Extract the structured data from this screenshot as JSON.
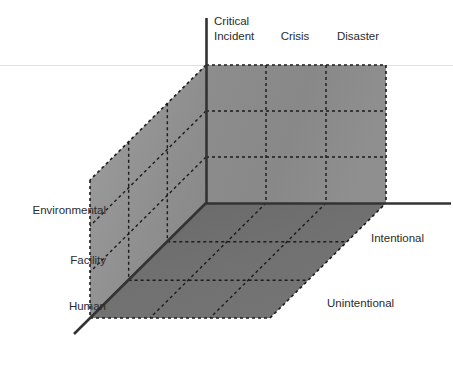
{
  "figure": {
    "title": "",
    "kind": "3d-cube-taxonomy-diagram"
  },
  "chart_data": {
    "type": "scatter",
    "title": "",
    "subtitle": "",
    "xlabel": "",
    "ylabel": "",
    "zlabel": "",
    "grid": true,
    "legend_position": "none",
    "axes": [
      {
        "name": "severity-axis",
        "position": "top",
        "direction": "horizontal",
        "categories": [
          "Critical Incident",
          "Crisis",
          "Disaster"
        ],
        "divisions": 3
      },
      {
        "name": "impact-axis",
        "position": "left",
        "direction": "vertical",
        "categories": [
          "Environmental",
          "Facility",
          "Human"
        ],
        "divisions": 3
      },
      {
        "name": "causation-axis",
        "position": "right",
        "direction": "depth",
        "categories": [
          "Intentional",
          "Unintentional"
        ],
        "divisions": 3
      }
    ],
    "cells": 27,
    "values": []
  },
  "labels": {
    "top": [
      {
        "id": "critical-incident",
        "line1": "Critical",
        "line2": "Incident",
        "text": "Critical Incident"
      },
      {
        "id": "crisis",
        "line1": "Crisis",
        "line2": "",
        "text": "Crisis"
      },
      {
        "id": "disaster",
        "line1": "Disaster",
        "line2": "",
        "text": "Disaster"
      }
    ],
    "left": [
      {
        "id": "environmental",
        "text": "Environmental"
      },
      {
        "id": "facility",
        "text": "Facility"
      },
      {
        "id": "human",
        "text": "Human"
      }
    ],
    "right": [
      {
        "id": "intentional",
        "text": "Intentional"
      },
      {
        "id": "unintentional",
        "text": "Unintentional"
      }
    ]
  },
  "colors": {
    "back_face": "#8a8a8a",
    "left_face": "#929292",
    "bottom_face": "#6d6d6d",
    "axis_line": "#333333",
    "grid_dotted": "#1c1c1c",
    "text": "#2b2b2b",
    "background": "#ffffff",
    "hairline": "#f4dede"
  }
}
